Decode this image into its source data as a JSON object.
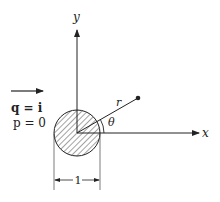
{
  "diagram": {
    "axes": {
      "x_label": "x",
      "y_label": "y"
    },
    "radius_label": "r",
    "angle_label": "θ",
    "flow": {
      "q_label": "q = i",
      "p_label": "p = 0"
    },
    "diameter_label": "1",
    "colors": {
      "ink": "#222222",
      "background": "#ffffff"
    }
  }
}
